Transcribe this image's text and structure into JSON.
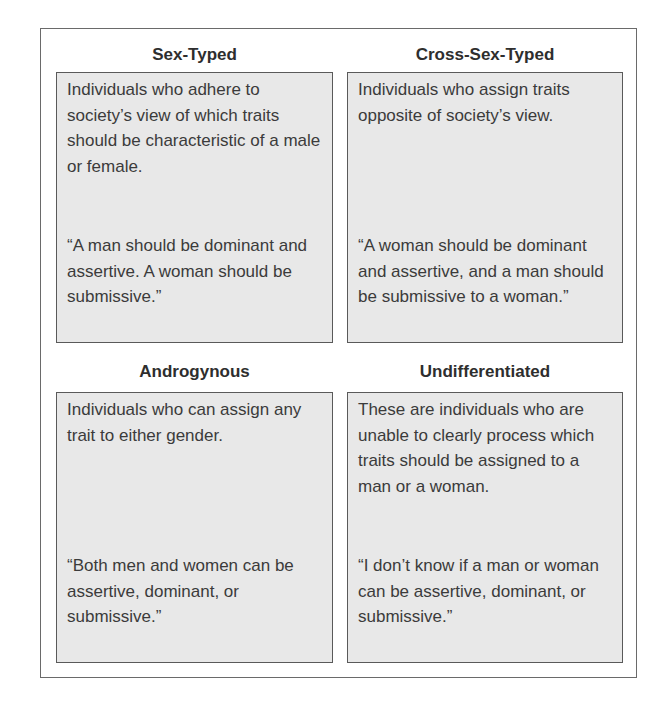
{
  "diagram": {
    "type": "2x2 quadrant grid",
    "quadrants": [
      {
        "id": "sex-typed",
        "title": "Sex-Typed",
        "description": "Individuals who adhere to society’s view of which traits should be characteristic of a male or female.",
        "quote": "“A man should be dominant and assertive. A woman should be submissive.”"
      },
      {
        "id": "cross-sex-typed",
        "title": "Cross-Sex-Typed",
        "description": "Individuals who assign traits opposite of society’s view.",
        "quote": "“A woman should be dominant and assertive, and a man should be submissive to a woman.”"
      },
      {
        "id": "androgynous",
        "title": "Androgynous",
        "description": "Individuals who can assign any trait to either gender.",
        "quote": "“Both men and women can be assertive, dominant, or submissive.”"
      },
      {
        "id": "undifferentiated",
        "title": "Undifferentiated",
        "description": "These are individuals who are unable to clearly process which traits should be assigned to a man or a woman.",
        "quote": "“I don’t know if a man or woman can be assertive, dominant, or submissive.”"
      }
    ]
  },
  "colors": {
    "box_fill": "#e8e8e8",
    "box_border": "#5a5a5a",
    "text": "#3b3b3b",
    "frame_border": "#6a6a6a"
  }
}
